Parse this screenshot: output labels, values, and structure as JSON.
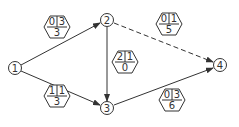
{
  "diagram": {
    "type": "activity-network",
    "nodes": [
      {
        "id": "1",
        "label": "1",
        "x": 15,
        "y": 68
      },
      {
        "id": "2",
        "label": "2",
        "x": 107,
        "y": 20
      },
      {
        "id": "3",
        "label": "3",
        "x": 107,
        "y": 108
      },
      {
        "id": "4",
        "label": "4",
        "x": 220,
        "y": 65
      }
    ],
    "edges": [
      {
        "from": "1",
        "to": "2",
        "style": "solid",
        "label": {
          "top_left": "0",
          "top_right": "3",
          "bottom": "3"
        }
      },
      {
        "from": "2",
        "to": "4",
        "style": "dashed",
        "label": {
          "top_left": "0",
          "top_right": "1",
          "bottom": "5"
        }
      },
      {
        "from": "2",
        "to": "3",
        "style": "solid",
        "label": {
          "top_left": "2",
          "top_right": "1",
          "bottom": "0"
        }
      },
      {
        "from": "1",
        "to": "3",
        "style": "solid",
        "label": {
          "top_left": "1",
          "top_right": "1",
          "bottom": "3"
        }
      },
      {
        "from": "3",
        "to": "4",
        "style": "solid",
        "label": {
          "top_left": "0",
          "top_right": "3",
          "bottom": "6"
        }
      }
    ]
  },
  "nodes": {
    "n1": "1",
    "n2": "2",
    "n3": "3",
    "n4": "4"
  },
  "hex": {
    "e12": {
      "a": "0",
      "b": "3",
      "c": "3"
    },
    "e24": {
      "a": "0",
      "b": "1",
      "c": "5"
    },
    "e23": {
      "a": "2",
      "b": "1",
      "c": "0"
    },
    "e13": {
      "a": "1",
      "b": "1",
      "c": "3"
    },
    "e34": {
      "a": "0",
      "b": "3",
      "c": "6"
    }
  }
}
